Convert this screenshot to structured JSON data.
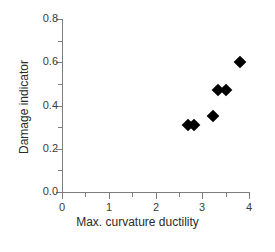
{
  "chart_data": {
    "type": "scatter",
    "title": "",
    "xlabel": "Max. curvature ductility",
    "ylabel": "Damage indicator",
    "xlim": [
      0,
      4
    ],
    "ylim": [
      0.0,
      0.8
    ],
    "grid": false,
    "legend": null,
    "marker": "filled-diamond",
    "marker_color": "#000000",
    "x_ticks": [
      0,
      1,
      2,
      3,
      4
    ],
    "x_tick_labels": [
      "0",
      "1",
      "2",
      "3",
      "4"
    ],
    "x_minor_ticks": [
      0.5,
      1.5,
      2.5,
      3.5
    ],
    "y_ticks": [
      0.0,
      0.2,
      0.4,
      0.6,
      0.8
    ],
    "y_tick_labels": [
      "0.0",
      "0.2",
      "0.4",
      "0.6",
      "0.8"
    ],
    "y_minor_ticks": [
      0.1,
      0.3,
      0.5,
      0.7
    ],
    "points": [
      {
        "x": 2.7,
        "y": 0.31
      },
      {
        "x": 2.83,
        "y": 0.31
      },
      {
        "x": 3.23,
        "y": 0.35
      },
      {
        "x": 3.33,
        "y": 0.47
      },
      {
        "x": 3.5,
        "y": 0.47
      },
      {
        "x": 3.8,
        "y": 0.6
      }
    ]
  },
  "axis_color": "#7d7d7d",
  "text_color": "#2b2b2b",
  "caption_fragment": ""
}
